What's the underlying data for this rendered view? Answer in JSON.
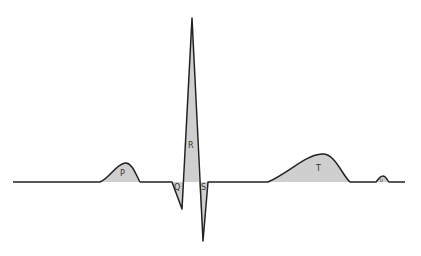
{
  "diagram": {
    "colors": {
      "trace": "#222222",
      "fill": "#cfcfcf",
      "background": "#ffffff"
    },
    "labels": {
      "p": "P",
      "q": "Q",
      "r": "R",
      "s": "S",
      "t": "T",
      "u": "U"
    }
  }
}
